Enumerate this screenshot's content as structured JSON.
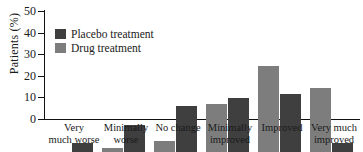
{
  "chart_data": {
    "type": "bar",
    "title": "",
    "xlabel": "",
    "ylabel": "Patients (%)",
    "ylim": [
      0,
      50
    ],
    "yticks": [
      0,
      10,
      20,
      30,
      40,
      50
    ],
    "grid": false,
    "legend_position": "top-left",
    "categories": [
      "Very much worse",
      "Minimally worse",
      "No change",
      "Minimally improved",
      "Improved",
      "Very much improved"
    ],
    "category_lines": [
      [
        "Very",
        "much worse"
      ],
      [
        "Minimally",
        "worse"
      ],
      [
        "No change",
        ""
      ],
      [
        "Minimally",
        "improved"
      ],
      [
        "Improved",
        ""
      ],
      [
        "Very much",
        "improved"
      ]
    ],
    "series": [
      {
        "name": "Drug treatment",
        "color": "#7d7d7d",
        "values": [
          0,
          2,
          5,
          22,
          40,
          29.5
        ]
      },
      {
        "name": "Placebo treatment",
        "color": "#3f3f3f",
        "values": [
          4,
          12.5,
          21.5,
          25,
          27,
          4
        ]
      }
    ]
  },
  "legend": {
    "items": [
      {
        "label": "Placebo treatment",
        "swatch": "placebo"
      },
      {
        "label": "Drug treatment",
        "swatch": "drug"
      }
    ]
  },
  "axis": {
    "y_title": "Patients (%)",
    "y_tick_labels": [
      "50",
      "40",
      "30",
      "20",
      "10",
      "0"
    ]
  }
}
